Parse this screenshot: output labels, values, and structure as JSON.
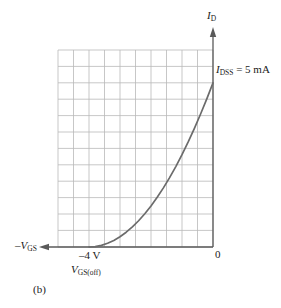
{
  "figure": {
    "panel_label": "(b)",
    "axis_color": "#5a5a5a",
    "grid_color": "#b9b9b9",
    "curve_color": "#6b6b6b",
    "text_color": "#1a1a1a"
  },
  "labels": {
    "y_axis": {
      "main": "I",
      "sub": "D"
    },
    "x_axis": {
      "main": "–V",
      "sub": "GS"
    },
    "idss": {
      "main": "I",
      "sub": "DSS",
      "rest": " = 5 mA"
    },
    "origin": "0",
    "vgs_off_value": "–4 V",
    "vgs_off_name": {
      "main": "V",
      "sub": "GS(off)"
    }
  },
  "chart_data": {
    "type": "line",
    "title": "",
    "subtitle": "(b)",
    "xlabel": "–V_GS",
    "ylabel": "I_D",
    "xlim": [
      -5.0,
      0.0
    ],
    "ylim": [
      0.0,
      6.0
    ],
    "grid": true,
    "grid_cols": 10,
    "grid_rows": 12,
    "x_tick_step": 0.5,
    "y_tick_step": 0.5,
    "legend": "none",
    "annotations": [
      {
        "text": "I_DSS = 5 mA",
        "x": 0.0,
        "y": 5.0
      },
      {
        "text": "0",
        "x": 0.0,
        "y": 0.0
      },
      {
        "text": "–4 V",
        "x": -4.0,
        "y": 0.0
      },
      {
        "text": "V_GS(off)",
        "x": -4.0,
        "y": 0.0
      }
    ],
    "parameters": {
      "IDSS_mA": 5,
      "VGS_off_V": -4,
      "equation": "ID = IDSS * (1 - VGS/VGS(off))^2"
    },
    "series": [
      {
        "name": "JFET transfer characteristic",
        "x": [
          -4.0,
          -3.8,
          -3.6,
          -3.4,
          -3.2,
          -3.0,
          -2.8,
          -2.6,
          -2.4,
          -2.2,
          -2.0,
          -1.8,
          -1.6,
          -1.4,
          -1.2,
          -1.0,
          -0.8,
          -0.6,
          -0.4,
          -0.2,
          0.0
        ],
        "y": [
          0.0,
          0.0125,
          0.05,
          0.1125,
          0.2,
          0.3125,
          0.45,
          0.6125,
          0.8,
          1.0125,
          1.25,
          1.5125,
          1.8,
          2.1125,
          2.45,
          2.8125,
          3.2,
          3.6125,
          4.05,
          4.5125,
          5.0
        ]
      }
    ]
  }
}
